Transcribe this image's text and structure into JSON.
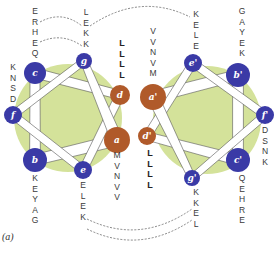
{
  "figure": {
    "panel_label": "(a)",
    "colors": {
      "hydrophobic_core_bg": "#d4e29a",
      "polar_position": "#3a3aa6",
      "core_position": "#b05a2a",
      "connector": "#ffffff",
      "connector_outline": "#555555",
      "text": "#3a3a3a"
    },
    "left_helix": {
      "positions": [
        {
          "id": "a",
          "label": "a",
          "type": "core",
          "sequence": [
            "M",
            "V",
            "N",
            "V",
            "V"
          ]
        },
        {
          "id": "b",
          "label": "b",
          "type": "polar",
          "sequence": [
            "K",
            "E",
            "Y",
            "A",
            "G"
          ]
        },
        {
          "id": "c",
          "label": "c",
          "type": "polar",
          "sequence": [
            "E",
            "R",
            "H",
            "E",
            "Q"
          ]
        },
        {
          "id": "d",
          "label": "d",
          "type": "core",
          "sequence": [
            "L",
            "L",
            "L",
            "L"
          ]
        },
        {
          "id": "e",
          "label": "e",
          "type": "polar",
          "sequence": [
            "E",
            "L",
            "E",
            "K"
          ]
        },
        {
          "id": "f",
          "label": "f",
          "type": "polar",
          "sequence": [
            "K",
            "N",
            "S",
            "D"
          ]
        },
        {
          "id": "g",
          "label": "g",
          "type": "polar",
          "sequence": [
            "L",
            "E",
            "K",
            "K"
          ]
        }
      ]
    },
    "right_helix": {
      "positions": [
        {
          "id": "a2",
          "label": "a'",
          "type": "core",
          "sequence": [
            "V",
            "V",
            "N",
            "V",
            "M"
          ]
        },
        {
          "id": "b2",
          "label": "b'",
          "type": "polar",
          "sequence": [
            "G",
            "A",
            "Y",
            "E",
            "K"
          ]
        },
        {
          "id": "c2",
          "label": "c'",
          "type": "polar",
          "sequence": [
            "Q",
            "E",
            "H",
            "R",
            "E"
          ]
        },
        {
          "id": "d2",
          "label": "d'",
          "type": "core",
          "sequence": [
            "L",
            "L",
            "L",
            "L"
          ]
        },
        {
          "id": "e2",
          "label": "e'",
          "type": "polar",
          "sequence": [
            "K",
            "E",
            "L",
            "E"
          ]
        },
        {
          "id": "f2",
          "label": "f'",
          "type": "polar",
          "sequence": [
            "D",
            "S",
            "N",
            "K"
          ]
        },
        {
          "id": "g2",
          "label": "g'",
          "type": "polar",
          "sequence": [
            "K",
            "K",
            "E",
            "L"
          ]
        }
      ]
    },
    "interactions": [
      {
        "from": "g",
        "to": "e2",
        "note": "interhelical salt bridges (dashed)"
      },
      {
        "from": "e",
        "to": "g2",
        "note": "interhelical salt bridges (dashed)"
      },
      {
        "from": "c",
        "to": "g",
        "note": "intrahelical (dashed)"
      }
    ]
  }
}
